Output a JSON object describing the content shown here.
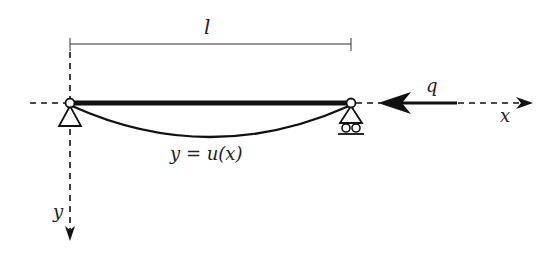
{
  "diagram": {
    "type": "simply-supported beam with axial compressive load",
    "labels": {
      "length": "l",
      "load": "q",
      "x_axis": "x",
      "y_axis": "y",
      "deflection_curve": "y = u(x)"
    },
    "elements": {
      "beam": "horizontal thick beam between two pin joints",
      "left_support": "pinned support (triangle)",
      "right_support": "roller support (triangle on two rollers)",
      "deflected_shape": "curved line sagging below beam",
      "load_arrow": "large arrow pointing left toward right end",
      "dimension_line": "span dimension with end ticks"
    },
    "colors": {
      "ink": "#111111",
      "background": "#ffffff"
    }
  }
}
